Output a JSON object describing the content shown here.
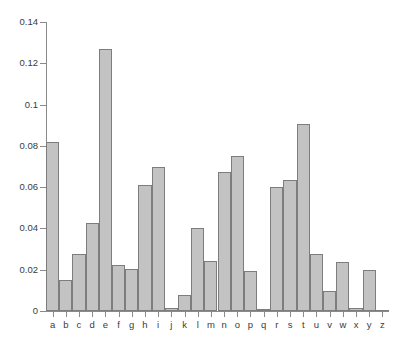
{
  "chart_data": {
    "type": "bar",
    "title": "",
    "subtitle": "",
    "xlabel": "",
    "ylabel": "",
    "categories": [
      "a",
      "b",
      "c",
      "d",
      "e",
      "f",
      "g",
      "h",
      "i",
      "j",
      "k",
      "l",
      "m",
      "n",
      "o",
      "p",
      "q",
      "r",
      "s",
      "t",
      "u",
      "v",
      "w",
      "x",
      "y",
      "z"
    ],
    "values": [
      0.0817,
      0.015,
      0.0278,
      0.0425,
      0.127,
      0.0223,
      0.0202,
      0.0609,
      0.0697,
      0.0015,
      0.0077,
      0.0403,
      0.0241,
      0.0675,
      0.0751,
      0.0193,
      0.001,
      0.0599,
      0.0633,
      0.0906,
      0.0276,
      0.0098,
      0.0236,
      0.0015,
      0.0197,
      0.0007
    ],
    "ylim": [
      0,
      0.14
    ],
    "xlim_labels": [
      "a",
      "z"
    ],
    "ytick_labels": [
      "0",
      "0.02",
      "0.04",
      "0.06",
      "0.08",
      "0.1",
      "0.12",
      "0.14"
    ],
    "ytick_values": [
      0,
      0.02,
      0.04,
      0.06,
      0.08,
      0.1,
      0.12,
      0.14
    ],
    "grid": false,
    "legend": null,
    "legend_position": "none",
    "annotations": [],
    "series": [
      {
        "name": "frequency",
        "values": [
          0.0817,
          0.015,
          0.0278,
          0.0425,
          0.127,
          0.0223,
          0.0202,
          0.0609,
          0.0697,
          0.0015,
          0.0077,
          0.0403,
          0.0241,
          0.0675,
          0.0751,
          0.0193,
          0.001,
          0.0599,
          0.0633,
          0.0906,
          0.0276,
          0.0098,
          0.0236,
          0.0015,
          0.0197,
          0.0007
        ]
      }
    ]
  },
  "style": {
    "bar_fill": "#c3c3c3",
    "bar_stroke": "#7d7d7d",
    "axis_color": "#8a8a8a",
    "text_color": "#3b3b3b",
    "background": "#ffffff"
  }
}
